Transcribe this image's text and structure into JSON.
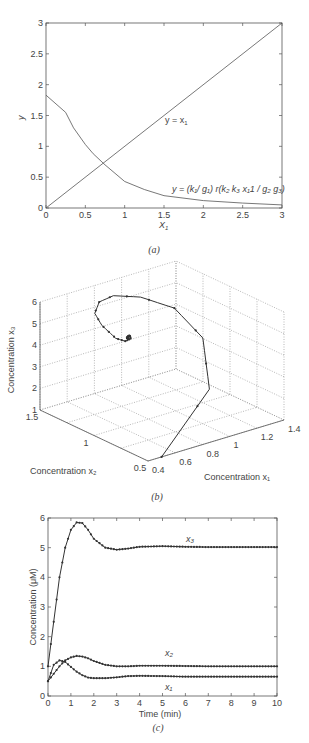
{
  "chart_data": [
    {
      "id": "a",
      "type": "line",
      "caption": "(a)",
      "xlabel": "X1",
      "ylabel": "y",
      "xlim": [
        0,
        3
      ],
      "ylim": [
        0,
        3
      ],
      "xticks": [
        "0",
        "0.5",
        "1",
        "1.5",
        "2",
        "2.5",
        "3"
      ],
      "yticks": [
        "0",
        "0.5",
        "1",
        "1.5",
        "2",
        "2.5",
        "3"
      ],
      "grid": false,
      "series": [
        {
          "name": "y = x1",
          "x": [
            0,
            3
          ],
          "y": [
            0,
            3
          ]
        },
        {
          "name": "y = (k1/ g1) r(k2 k3 x11 / g2 g3)",
          "x": [
            0,
            0.25,
            0.35,
            0.5,
            0.6,
            0.75,
            1.0,
            1.25,
            1.5,
            2.0,
            2.5,
            3.0
          ],
          "y": [
            1.83,
            1.55,
            1.3,
            1.03,
            0.88,
            0.7,
            0.43,
            0.3,
            0.2,
            0.12,
            0.08,
            0.05
          ]
        }
      ],
      "annotations": [
        {
          "text": "y = x1",
          "x": 1.55,
          "y": 1.3
        },
        {
          "text": "y = (k1/ g1) r(k2 k3 x11 / g2 g3)",
          "x": 1.7,
          "y": 0.25
        }
      ]
    },
    {
      "id": "b",
      "type": "line3d",
      "caption": "(b)",
      "xlabel": "Concentration x1",
      "ylabel": "Concentration x2",
      "zlabel": "Concentration x3",
      "xlim": [
        0.4,
        1.4
      ],
      "ylim": [
        0.5,
        1.5
      ],
      "zlim": [
        1,
        6
      ],
      "xticks": [
        "0.4",
        "0.6",
        "0.8",
        "1",
        "1.2",
        "1.4"
      ],
      "yticks": [
        "0.5",
        "1",
        "1.5"
      ],
      "zticks": [
        "1",
        "2",
        "3",
        "4",
        "5",
        "6"
      ],
      "grid": true,
      "trajectory_note": "Spiral from (x1≈0.5, x2≈0.5, x3≈1) rising to x3≈5.8 and converging to (0.65, 1.0, 5.0)"
    },
    {
      "id": "c",
      "type": "line",
      "caption": "(c)",
      "xlabel": "Time (min)",
      "ylabel": "Concentration (μM)",
      "xlim": [
        0,
        10
      ],
      "ylim": [
        0,
        6
      ],
      "xticks": [
        "0",
        "1",
        "2",
        "3",
        "4",
        "5",
        "6",
        "7",
        "8",
        "9",
        "10"
      ],
      "yticks": [
        "0",
        "1",
        "2",
        "3",
        "4",
        "5",
        "6"
      ],
      "grid": false,
      "x": [
        0,
        0.25,
        0.5,
        0.75,
        1.0,
        1.25,
        1.5,
        1.75,
        2.0,
        2.5,
        3.0,
        3.5,
        4.0,
        5.0,
        6.0,
        7.0,
        8.0,
        9.0,
        10.0
      ],
      "series": [
        {
          "name": "x1",
          "values": [
            0.5,
            1.05,
            1.2,
            1.15,
            0.98,
            0.82,
            0.7,
            0.62,
            0.6,
            0.6,
            0.63,
            0.67,
            0.68,
            0.67,
            0.65,
            0.65,
            0.65,
            0.65,
            0.65
          ]
        },
        {
          "name": "x2",
          "values": [
            0.5,
            0.75,
            1.0,
            1.2,
            1.3,
            1.35,
            1.33,
            1.27,
            1.18,
            1.05,
            1.0,
            1.0,
            1.02,
            1.02,
            1.01,
            1.0,
            1.0,
            1.0,
            1.0
          ]
        },
        {
          "name": "x3",
          "values": [
            1.0,
            2.5,
            4.0,
            5.0,
            5.6,
            5.85,
            5.83,
            5.6,
            5.3,
            5.0,
            4.93,
            4.97,
            5.03,
            5.05,
            5.03,
            5.02,
            5.02,
            5.02,
            5.02
          ]
        }
      ],
      "annotations": [
        {
          "text": "x3",
          "x": 6.1,
          "y": 5.35
        },
        {
          "text": "x2",
          "x": 5.2,
          "y": 1.45
        },
        {
          "text": "x1",
          "x": 5.2,
          "y": 0.35
        }
      ]
    }
  ],
  "labels": {
    "a": {
      "ylabel": "y",
      "xlabel": "X",
      "xlabel_sub": "1",
      "caption": "(a)",
      "line_label": "y = x",
      "line_sub": "1",
      "curve_label": "y = (k₁/ g₁) r(k₂ k₃ x₁1 / g₂ g₃)"
    },
    "b": {
      "zlabel": "Concentration x₃",
      "xlabel": "Concentration x₁",
      "ylabel": "Concentration x₂",
      "caption": "(b)"
    },
    "c": {
      "ylabel": "Concentration (μM)",
      "xlabel": "Time (min)",
      "caption": "(c)",
      "x3": "x₃",
      "x2": "x₂",
      "x1": "x₁"
    }
  }
}
